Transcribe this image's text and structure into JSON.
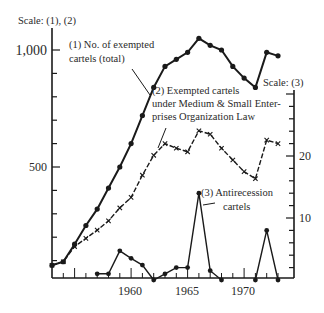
{
  "chart_data": {
    "type": "line",
    "title": "",
    "xlabel": "",
    "ylabel_left": "Scale: (1), (2)",
    "ylabel_right": "Scale: (3)",
    "x": [
      1953,
      1954,
      1955,
      1956,
      1957,
      1958,
      1959,
      1960,
      1961,
      1962,
      1963,
      1964,
      1965,
      1966,
      1967,
      1968,
      1969,
      1970,
      1971,
      1972,
      1973
    ],
    "x_ticks": [
      1960,
      1965,
      1970
    ],
    "x_tick_labels": [
      "1960",
      "1965",
      "1970"
    ],
    "ylim_left": [
      0,
      1000
    ],
    "y_ticks_left_labeled": [
      500,
      1000
    ],
    "y_tick_labels_left": [
      "500",
      "1,000"
    ],
    "ylim_right": [
      0,
      25
    ],
    "y_ticks_right_labeled": [
      10,
      20
    ],
    "y_tick_labels_right": [
      "10",
      "20"
    ],
    "grid": false,
    "series": [
      {
        "name": "(1) No. of exempted cartels (total)",
        "axis": "left",
        "marker": "dot",
        "x": [
          1953,
          1954,
          1955,
          1956,
          1957,
          1958,
          1959,
          1960,
          1961,
          1962,
          1963,
          1964,
          1965,
          1966,
          1967,
          1968,
          1969,
          1970,
          1971,
          1972,
          1973
        ],
        "values": [
          80,
          95,
          170,
          250,
          320,
          410,
          500,
          600,
          720,
          840,
          930,
          960,
          990,
          1050,
          1020,
          1000,
          930,
          880,
          840,
          990,
          975
        ]
      },
      {
        "name": "(2) Exempted cartels under Medium & Small Enterprises Organization Law",
        "axis": "left",
        "marker": "x",
        "x": [
          1953,
          1954,
          1955,
          1956,
          1957,
          1958,
          1959,
          1960,
          1961,
          1962,
          1963,
          1964,
          1965,
          1966,
          1967,
          1968,
          1969,
          1970,
          1971,
          1972,
          1973
        ],
        "values": [
          80,
          95,
          160,
          195,
          230,
          270,
          325,
          370,
          465,
          550,
          600,
          580,
          565,
          655,
          640,
          580,
          530,
          480,
          450,
          615,
          600
        ]
      },
      {
        "name": "(3) Antirecession cartels",
        "axis": "right",
        "marker": "dot",
        "x": [
          1957,
          1958,
          1959,
          1960,
          1961,
          1962,
          1963,
          1964,
          1965,
          1966,
          1967,
          1968,
          1971,
          1972,
          1973
        ],
        "values": [
          1,
          1,
          4.7,
          3.5,
          2.4,
          0,
          1,
          2,
          2,
          14,
          1.5,
          0,
          0,
          8,
          0
        ]
      }
    ],
    "annotations": [
      "(1) No. of exempted cartels (total)",
      "(2) Exempted cartels under Medium & Small Enterprises Organization Law",
      "(3) Antirecession cartels"
    ]
  },
  "labels": {
    "scale_left": "Scale: (1), (2)",
    "scale_right": "Scale: (3)",
    "y1000": "1,000",
    "y500": "500",
    "r20": "20",
    "r10": "10",
    "x1960": "1960",
    "x1965": "1965",
    "x1970": "1970",
    "s1_line1": "(1) No. of exempted",
    "s1_line2": "cartels (total)",
    "s2_line1": "(2) Exempted cartels",
    "s2_line2": "under Medium & Small Enter-",
    "s2_line3": "prises  Organization  Law",
    "s3_line1": "(3)  Antirecession",
    "s3_line2": "cartels"
  }
}
